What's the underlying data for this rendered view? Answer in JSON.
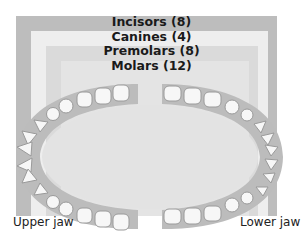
{
  "tooth_types": [
    {
      "label": "Incisors (8)",
      "name": "Incisors",
      "count": 8
    },
    {
      "label": "Canines (4)",
      "name": "Canines",
      "count": 4
    },
    {
      "label": "Premolars (8)",
      "name": "Premolars",
      "count": 8
    },
    {
      "label": "Molars (12)",
      "name": "Molars",
      "count": 12
    }
  ],
  "jaws": {
    "upper": "Upper jaw",
    "lower": "Lower jaw"
  },
  "colors": {
    "band_incisors": "#bdbdbd",
    "band_canines": "#eeeeee",
    "band_premolars": "#dadada",
    "band_molars": "#e4e4e4",
    "gum": "#bcbcbc",
    "palate": "#e3e3e3",
    "tooth": "#f7f7f7"
  }
}
